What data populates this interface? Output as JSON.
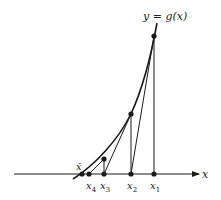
{
  "diagram": {
    "curve_label": "y = g(x)",
    "axis_label": "x",
    "fixed_point_label": "x̄",
    "iterate_labels": [
      {
        "name": "x",
        "sub": "1"
      },
      {
        "name": "x",
        "sub": "2"
      },
      {
        "name": "x",
        "sub": "3"
      },
      {
        "name": "x",
        "sub": "4"
      }
    ],
    "colors": {
      "stroke": "#1a1a1a",
      "background": "#ffffff"
    }
  }
}
